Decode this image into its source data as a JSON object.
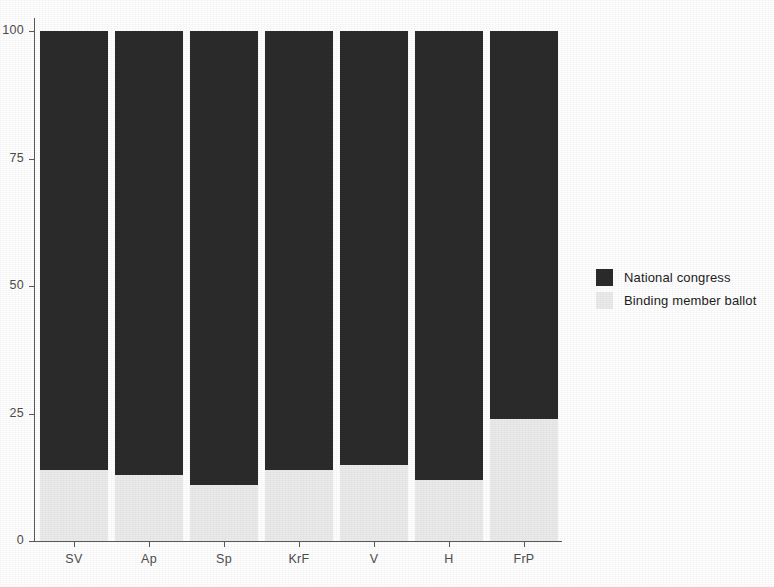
{
  "chart_data": {
    "type": "bar",
    "subtype": "stacked-bar-percent",
    "title": "",
    "subtitle": "",
    "xlabel": "",
    "ylabel": "",
    "categories": [
      "SV",
      "Ap",
      "Sp",
      "KrF",
      "V",
      "H",
      "FrP"
    ],
    "series": [
      {
        "name": "National congress",
        "color": "#2b2b2b",
        "values": [
          86,
          87,
          89,
          86,
          85,
          88,
          76
        ]
      },
      {
        "name": "Binding member ballot",
        "color": "#ebebeb",
        "values": [
          14,
          13,
          11,
          14,
          15,
          12,
          24
        ]
      }
    ],
    "ylim": [
      0,
      100
    ],
    "yticks": [
      0,
      25,
      50,
      75,
      100
    ],
    "ytick_labels": [
      "0",
      "25",
      "50",
      "75",
      "100"
    ],
    "grid": false,
    "legend_position": "right"
  },
  "legend": {
    "entries": [
      {
        "label": "National congress",
        "color": "#2b2b2b"
      },
      {
        "label": "Binding member ballot",
        "color": "#ebebeb"
      }
    ]
  },
  "axis": {
    "line_color": "#5a5a5a",
    "tick_label_color": "#4d4d4d"
  }
}
